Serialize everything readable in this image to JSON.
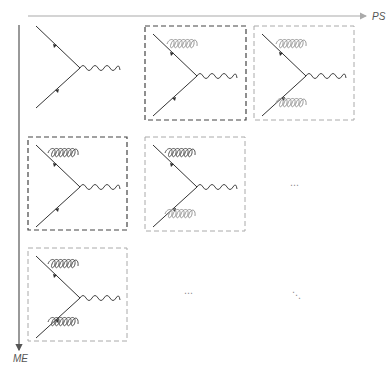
{
  "axes": {
    "horizontal": {
      "label": "PS",
      "color": "#aaaaaa"
    },
    "vertical": {
      "label": "ME",
      "color": "#555555"
    }
  },
  "colors": {
    "fermion": "#333333",
    "photon": "#444444",
    "gluon_dark": "#555555",
    "gluon_light": "#9a9a9a",
    "box_dark": "#444444",
    "box_light": "#aaaaaa"
  },
  "grid": [
    {
      "row": 0,
      "col": 0,
      "diagram": "born",
      "gluons": [],
      "box": "none"
    },
    {
      "row": 0,
      "col": 1,
      "diagram": "1 PS emission",
      "gluons": [
        "top-light"
      ],
      "box": "dark"
    },
    {
      "row": 0,
      "col": 2,
      "diagram": "2 PS emissions",
      "gluons": [
        "top-light",
        "bottom-light"
      ],
      "box": "light"
    },
    {
      "row": 1,
      "col": 0,
      "diagram": "1 ME emission",
      "gluons": [
        "top-dark"
      ],
      "box": "dark"
    },
    {
      "row": 1,
      "col": 1,
      "diagram": "1 ME + 1 PS emission",
      "gluons": [
        "top-dark",
        "bottom-light"
      ],
      "box": "light"
    },
    {
      "row": 2,
      "col": 0,
      "diagram": "2 ME emissions",
      "gluons": [
        "top-dark",
        "bottom-dark"
      ],
      "box": "light"
    }
  ],
  "ellipses": {
    "row1_col2": "⋯",
    "row2_col1": "⋯",
    "row2_col2": "⋱"
  }
}
